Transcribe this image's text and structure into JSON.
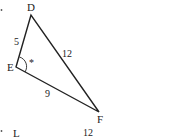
{
  "triangle": {
    "vertices": {
      "D": {
        "label": "D",
        "x": 31,
        "y": 15
      },
      "E": {
        "label": "E",
        "x": 16,
        "y": 67
      },
      "F": {
        "label": "F",
        "x": 99,
        "y": 112
      }
    },
    "sides": {
      "DE": "5",
      "DF": "12",
      "EF": "9"
    },
    "angle_marker": "*"
  },
  "next_figure": {
    "vertex_label": "L",
    "side_label": "12"
  },
  "colors": {
    "line": "#222222",
    "background": "#ffffff"
  }
}
